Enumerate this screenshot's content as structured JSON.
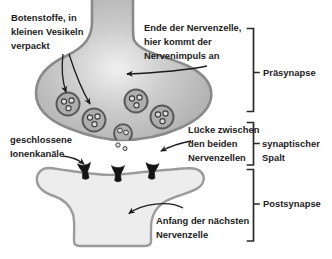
{
  "figure": {
    "title_semantic": "Aufbau einer Synapse (structure of a synapse)",
    "background": "#ffffff",
    "colors": {
      "presynapse_fill": "#b3b3b3",
      "presynapse_highlight": "#efefef",
      "membrane_outline": "#8a8a8a",
      "vesicle_fill": "#adadad",
      "vesicle_outline": "#5a5a5a",
      "neurotransmitter_dot_fill": "#dcdcdc",
      "postsynapse_fill": "#ededed",
      "postsynapse_outline": "#9b9b9b",
      "ion_channel": "#141414",
      "annotation": "#1c1c1c"
    },
    "labels": {
      "botenstoffe": {
        "line1": "Botenstoffe, in",
        "line2": "kleinen Vesikeln",
        "line3": "verpackt"
      },
      "ende": {
        "line1": "Ende der Nervenzelle,",
        "line2": "hier kommt der",
        "line3": "Nervenimpuls an"
      },
      "praesynapse": "Präsynapse",
      "luecke": {
        "line1": "Lücke zwischen",
        "line2": "den beiden",
        "line3": "Nervenzellen"
      },
      "spalt": {
        "line1": "synaptischer",
        "line2": "Spalt"
      },
      "geschlossene": {
        "line1": "geschlossene",
        "line2": "Ionenkanäle"
      },
      "anfang": {
        "line1": "Anfang der nächsten",
        "line2": "Nervenzelle"
      },
      "postsynapse": "Postsynapse"
    }
  }
}
